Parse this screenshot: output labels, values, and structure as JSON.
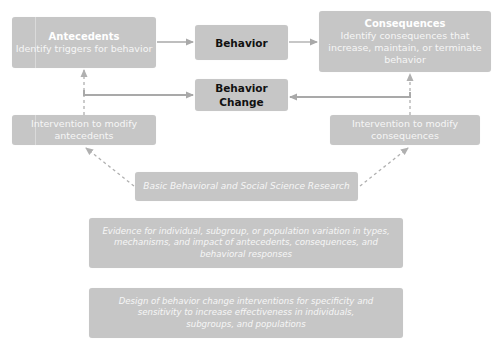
{
  "diagram": {
    "antecedents": {
      "title": "Antecedents",
      "subtitle": "Identify triggers for behavior"
    },
    "behavior": {
      "title": "Behavior"
    },
    "consequences": {
      "title": "Consequences",
      "subtitle": "Identify consequences that increase, maintain, or terminate behavior"
    },
    "behavior_change": {
      "title_line1": "Behavior",
      "title_line2": "Change"
    },
    "intervention_antecedents": {
      "line1": "Intervention to modify",
      "line2": "antecedents"
    },
    "intervention_consequences": {
      "line1": "Intervention to modify",
      "line2": "consequences"
    },
    "basic_research": {
      "text": "Basic Behavioral and Social Science Research"
    },
    "evidence": {
      "line1": "Evidence for individual, subgroup, or population variation in types,",
      "line2": "mechanisms, and impact of antecedents, consequences, and",
      "line3": "behavioral responses"
    },
    "design": {
      "line1": "Design of behavior change interventions for specificity and",
      "line2": "sensitivity to increase effectiveness in individuals,",
      "line3": "subgroups, and populations"
    },
    "colors": {
      "box_fill": "#c6c6c6",
      "arrow": "#a9a9a9",
      "dashed_arrow": "#b0b0b0",
      "dark_text": "#111111",
      "light_text": "#f6f6f6"
    }
  }
}
